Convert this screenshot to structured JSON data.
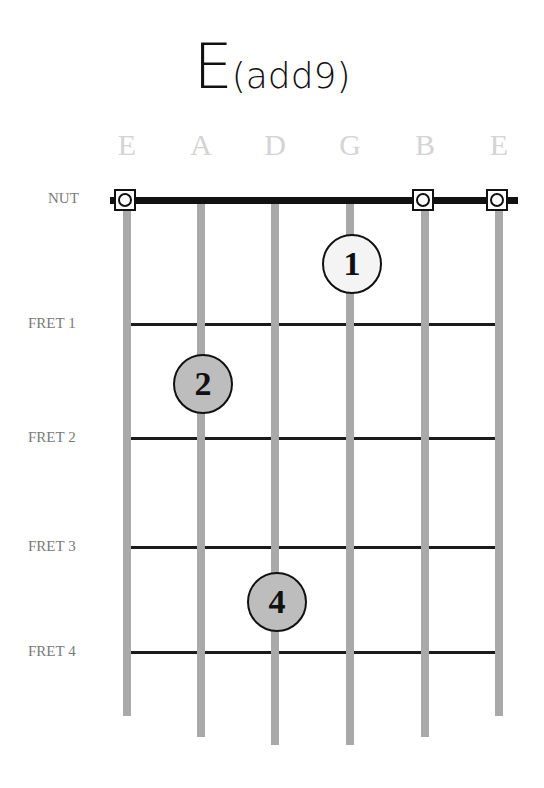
{
  "title": {
    "root": "E",
    "extension": "(add9)"
  },
  "strings": [
    {
      "label": "E",
      "x": 127,
      "bottom": 716
    },
    {
      "label": "A",
      "x": 201,
      "bottom": 737
    },
    {
      "label": "D",
      "x": 275,
      "bottom": 745
    },
    {
      "label": "G",
      "x": 350,
      "bottom": 745
    },
    {
      "label": "B",
      "x": 425,
      "bottom": 737
    },
    {
      "label": "E",
      "x": 499,
      "bottom": 716
    }
  ],
  "nut_label": "NUT",
  "frets": [
    {
      "label": "FRET 1",
      "y": 324
    },
    {
      "label": "FRET 2",
      "y": 438
    },
    {
      "label": "FRET 3",
      "y": 547
    },
    {
      "label": "FRET 4",
      "y": 652
    }
  ],
  "open_strings": [
    {
      "string": "E (low)",
      "x": 127
    },
    {
      "string": "B",
      "x": 425
    },
    {
      "string": "E (high)",
      "x": 499
    }
  ],
  "fingers": [
    {
      "number": "1",
      "string": "G",
      "x": 350,
      "y": 262,
      "fill": "#f4f4f4"
    },
    {
      "number": "2",
      "string": "A",
      "x": 201,
      "y": 382,
      "fill": "#bdbdbd"
    },
    {
      "number": "4",
      "string": "D",
      "x": 275,
      "y": 600,
      "fill": "#bdbdbd"
    }
  ],
  "colors": {
    "string": "#a9a9a9",
    "fret": "#1a1a1a",
    "label_gray": "#7a7a7a",
    "string_label": "#d4d4d4"
  }
}
